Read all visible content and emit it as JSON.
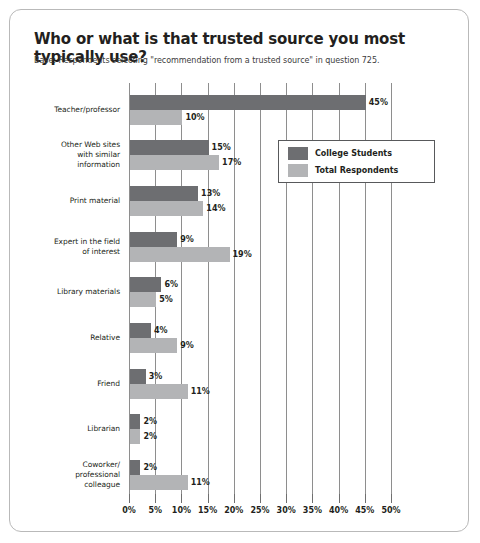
{
  "card": {
    "title": "Who or what is that trusted source you most typically use?",
    "subtitle": "Base: Respondents selecting \"recommendation from a trusted source\" in question 725."
  },
  "legend": {
    "items": [
      {
        "label": "College Students",
        "color": "#6d6e71"
      },
      {
        "label": "Total Respondents",
        "color": "#b3b4b6"
      }
    ]
  },
  "chart_data": {
    "type": "bar",
    "orientation": "horizontal",
    "title": "Who or what is that trusted source you most typically use?",
    "subtitle": "Base: Respondents selecting \"recommendation from a trusted source\" in question 725.",
    "xlabel": "",
    "ylabel": "",
    "xlim": [
      0,
      50
    ],
    "xticks": [
      0,
      5,
      10,
      15,
      20,
      25,
      30,
      35,
      40,
      45,
      50
    ],
    "xticklabels": [
      "0%",
      "5%",
      "10%",
      "15%",
      "20%",
      "25%",
      "30%",
      "35%",
      "40%",
      "45%",
      "50%"
    ],
    "grid": true,
    "legend_position": "upper right",
    "categories": [
      "Teacher/professor",
      "Other Web sites with similar information",
      "Print material",
      "Expert in the field of interest",
      "Library materials",
      "Relative",
      "Friend",
      "Librarian",
      "Coworker/professional colleague"
    ],
    "category_lines": [
      [
        "Teacher/professor"
      ],
      [
        "Other Web sites",
        "with similar",
        "information"
      ],
      [
        "Print material"
      ],
      [
        "Expert in the field",
        "of interest"
      ],
      [
        "Library materials"
      ],
      [
        "Relative"
      ],
      [
        "Friend"
      ],
      [
        "Librarian"
      ],
      [
        "Coworker/",
        "professional",
        "colleague"
      ]
    ],
    "series": [
      {
        "name": "College Students",
        "color": "#6d6e71",
        "values": [
          45,
          15,
          13,
          9,
          6,
          4,
          3,
          2,
          2
        ],
        "labels": [
          "45%",
          "15%",
          "13%",
          "9%",
          "6%",
          "4%",
          "3%",
          "2%",
          "2%"
        ]
      },
      {
        "name": "Total Respondents",
        "color": "#b3b4b6",
        "values": [
          10,
          17,
          14,
          19,
          5,
          9,
          11,
          2,
          11
        ],
        "labels": [
          "10%",
          "17%",
          "14%",
          "19%",
          "5%",
          "9%",
          "11%",
          "2%",
          "11%"
        ]
      }
    ]
  }
}
